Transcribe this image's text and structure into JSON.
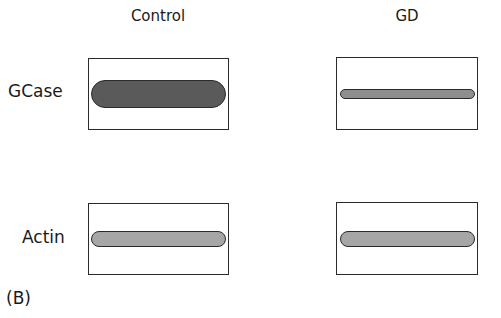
{
  "figure": {
    "panel_label": "(B)",
    "columns": [
      {
        "label": "Control"
      },
      {
        "label": "GD"
      }
    ],
    "rows": [
      {
        "label": "GCase"
      },
      {
        "label": "Actin"
      }
    ],
    "bands": [
      {
        "row": "GCase",
        "column": "Control",
        "intensity": "strong",
        "thickness": "thick",
        "color": "#5a5a5a"
      },
      {
        "row": "GCase",
        "column": "GD",
        "intensity": "weak",
        "thickness": "thin",
        "color": "#8e8e8e"
      },
      {
        "row": "Actin",
        "column": "Control",
        "intensity": "medium",
        "thickness": "medium",
        "color": "#a6a6a6"
      },
      {
        "row": "Actin",
        "column": "GD",
        "intensity": "medium",
        "thickness": "medium",
        "color": "#a6a6a6"
      }
    ]
  }
}
